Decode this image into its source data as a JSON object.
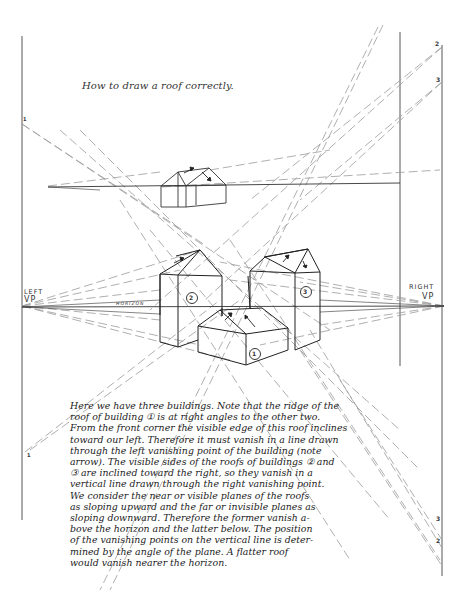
{
  "title": "How to draw a roof correctly.",
  "labels": {
    "left_vp_line1": "LEFT",
    "left_vp_line2": "VP",
    "right_vp_line1": "RIGHT",
    "right_vp_line2": "VP",
    "horizon": "HORIZON",
    "building_1": "1",
    "building_2": "2",
    "building_3": "3"
  },
  "vertical_line_marks": {
    "left_top": "1",
    "left_bottom": "1",
    "right_top_2": "2",
    "right_top_3": "3",
    "right_bottom_3": "3",
    "right_bottom_2": "2"
  },
  "caption_lines": [
    "Here we have three buildings.  Note that the ridge of the",
    "roof of building ① is at right angles to the other two.",
    "From the front corner the visible edge of this roof inclines",
    "toward our left. Therefore it must vanish in a line drawn",
    "through the left vanishing point of the building (note",
    "arrow). The visible sides of the roofs of buildings ② and",
    "③ are inclined toward the right, so they vanish in a",
    "vertical line drawn through the right vanishing point.",
    "We consider the near or visible planes of the roofs",
    "as sloping upward and the far or invisible planes as",
    "sloping downward. Therefore the former vanish a-",
    "bove the horizon and the latter below. The position",
    "of the vanishing points on the vertical line is deter-",
    "mined by the angle of the plane. A flatter roof",
    "would vanish nearer the horizon."
  ],
  "colors": {
    "ink": "#222222",
    "construction_line": "#9a9a9a",
    "background": "#ffffff"
  }
}
